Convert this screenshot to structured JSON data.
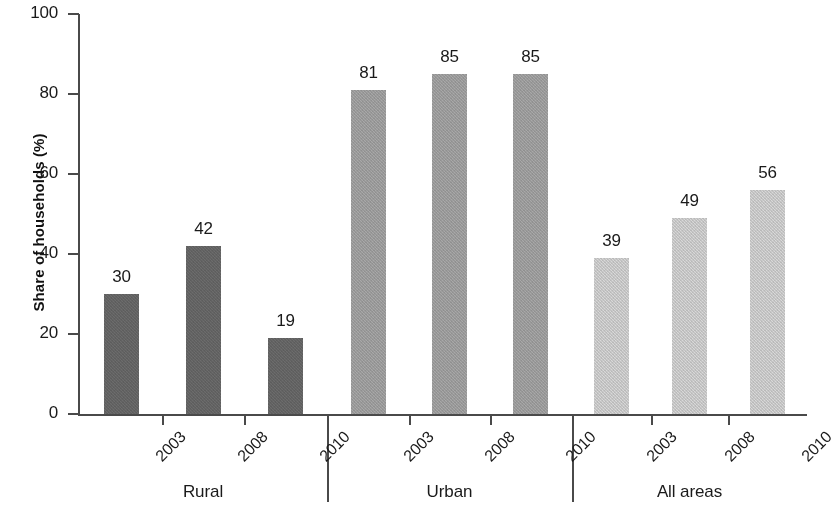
{
  "chart_data": {
    "type": "bar",
    "title": "",
    "xlabel": "",
    "ylabel": "Share of households (%)",
    "ylim": [
      0,
      100
    ],
    "yticks": [
      0,
      20,
      40,
      60,
      80,
      100
    ],
    "grid": false,
    "legend": "none",
    "categories": [
      "2003",
      "2008",
      "2010"
    ],
    "groups": [
      {
        "name": "Rural",
        "color": "#6d6d6d",
        "bars": [
          {
            "category": "2003",
            "value": 30,
            "label": "30"
          },
          {
            "category": "2008",
            "value": 42,
            "label": "42"
          },
          {
            "category": "2010",
            "value": 19,
            "label": "19"
          }
        ]
      },
      {
        "name": "Urban",
        "color": "#a9a9a9",
        "bars": [
          {
            "category": "2003",
            "value": 81,
            "label": "81"
          },
          {
            "category": "2008",
            "value": 85,
            "label": "85"
          },
          {
            "category": "2010",
            "value": 85,
            "label": "85"
          }
        ]
      },
      {
        "name": "All areas",
        "color": "#d9d9d9",
        "bars": [
          {
            "category": "2003",
            "value": 39,
            "label": "39"
          },
          {
            "category": "2008",
            "value": 49,
            "label": "49"
          },
          {
            "category": "2010",
            "value": 56,
            "label": "56"
          }
        ]
      }
    ],
    "series": [
      {
        "name": "Rural",
        "values": [
          30,
          42,
          19
        ]
      },
      {
        "name": "Urban",
        "values": [
          81,
          85,
          85
        ]
      },
      {
        "name": "All areas",
        "values": [
          39,
          49,
          56
        ]
      }
    ],
    "axis_color": "#4a4a4a",
    "text_color": "#1a1a1a"
  },
  "axis": {
    "y_title": "Share of households (%)",
    "y_tick_labels": [
      "0",
      "20",
      "40",
      "60",
      "80",
      "100"
    ]
  }
}
